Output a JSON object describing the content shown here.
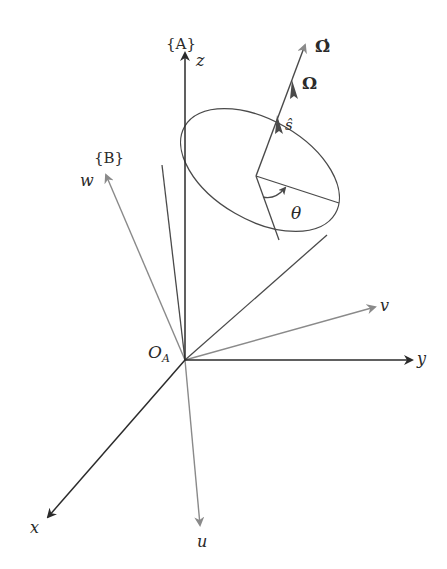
{
  "diagram": {
    "frame_a": {
      "label": "{A}",
      "axes": {
        "x": "x",
        "y": "y",
        "z": "z"
      },
      "origin_label": "O",
      "origin_subscript": "A",
      "color": "#2b2b2b"
    },
    "frame_b": {
      "label": "{B}",
      "axes": {
        "u": "u",
        "v": "v",
        "w": "w"
      },
      "color": "#8a8a8a"
    },
    "vectors": {
      "omega_dot": "Ω̇",
      "omega": "Ω",
      "s_hat": "ŝ"
    },
    "angle": {
      "label": "θ"
    },
    "cone": {
      "description": "cone with apex at origin, axis along ŝ"
    }
  }
}
